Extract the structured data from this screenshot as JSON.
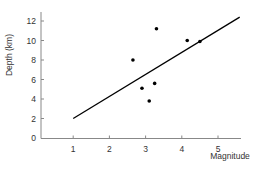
{
  "chart_data": {
    "type": "scatter",
    "title": "",
    "xlabel": "Magnitude",
    "ylabel": "Depth (km)",
    "xlim": [
      0,
      5.6
    ],
    "ylim": [
      0,
      13
    ],
    "x_ticks": [
      1,
      2,
      3,
      4,
      5
    ],
    "y_ticks": [
      0,
      2,
      4,
      6,
      8,
      10,
      12
    ],
    "grid": false,
    "legend": null,
    "series": [
      {
        "name": "Earthquakes",
        "type": "scatter",
        "points": [
          {
            "x": 2.65,
            "y": 8.0
          },
          {
            "x": 2.9,
            "y": 5.1
          },
          {
            "x": 3.1,
            "y": 3.8
          },
          {
            "x": 3.25,
            "y": 5.6
          },
          {
            "x": 3.3,
            "y": 11.2
          },
          {
            "x": 4.15,
            "y": 10.0
          },
          {
            "x": 4.5,
            "y": 9.9
          }
        ],
        "color": "#000000"
      },
      {
        "name": "Trend line",
        "type": "line",
        "points": [
          {
            "x": 1.0,
            "y": 2.0
          },
          {
            "x": 5.6,
            "y": 12.4
          }
        ],
        "color": "#000000"
      }
    ]
  },
  "labels": {
    "xlabel": "Magnitude",
    "ylabel": "Depth (km)",
    "x_ticks": [
      "1",
      "2",
      "3",
      "4",
      "5"
    ],
    "y_ticks": [
      "0",
      "2",
      "4",
      "6",
      "8",
      "10",
      "12"
    ]
  },
  "colors": {
    "axis": "#888888",
    "points": "#000000",
    "line": "#000000",
    "text": "#333333"
  }
}
